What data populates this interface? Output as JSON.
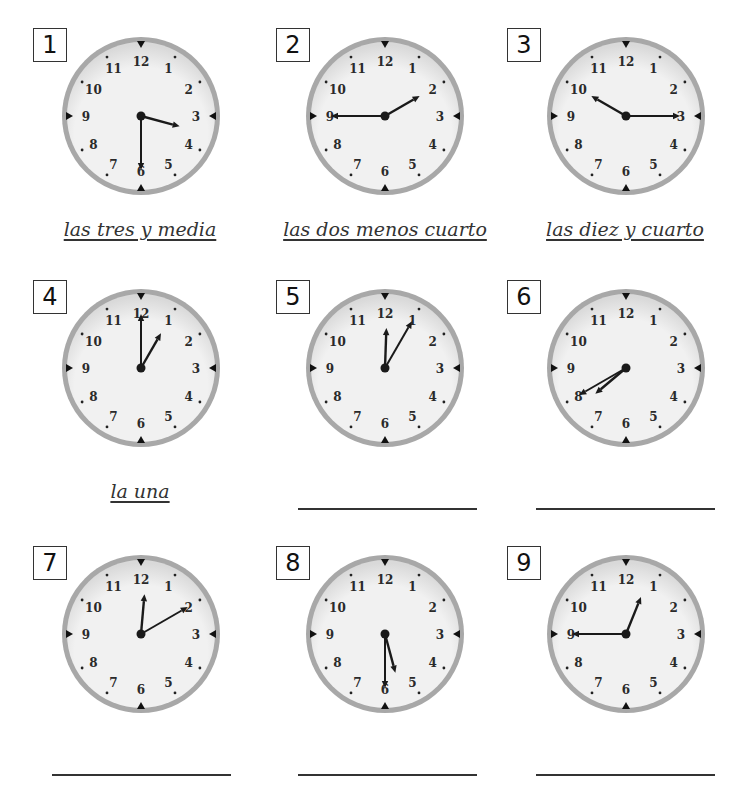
{
  "worksheet": {
    "colors": {
      "rim": "#a8a8a8",
      "face": "#f1f1f1",
      "face_shadow": "#d9d9d9",
      "hand": "#1a1a1a",
      "numerals": "#2a2a2a"
    },
    "clock_numerals": [
      "12",
      "1",
      "2",
      "3",
      "4",
      "5",
      "6",
      "7",
      "8",
      "9",
      "10",
      "11"
    ],
    "items": [
      {
        "number": "1",
        "time": "3:30",
        "hour_hand_deg": 105,
        "minute_hand_deg": 180,
        "answer": "las tres y media",
        "answered": true
      },
      {
        "number": "2",
        "time": "1:45",
        "hour_hand_deg": 60,
        "minute_hand_deg": 270,
        "answer": "las dos menos cuarto",
        "answered": true
      },
      {
        "number": "3",
        "time": "10:15",
        "hour_hand_deg": 300,
        "minute_hand_deg": 90,
        "answer": "las diez y cuarto",
        "answered": true
      },
      {
        "number": "4",
        "time": "1:00",
        "hour_hand_deg": 30,
        "minute_hand_deg": 0,
        "answer": "la una",
        "answered": true
      },
      {
        "number": "5",
        "time": "12:05",
        "hour_hand_deg": 2,
        "minute_hand_deg": 30,
        "answer": "",
        "answered": false
      },
      {
        "number": "6",
        "time": "7:40",
        "hour_hand_deg": 230,
        "minute_hand_deg": 240,
        "answer": "",
        "answered": false
      },
      {
        "number": "7",
        "time": "12:10",
        "hour_hand_deg": 5,
        "minute_hand_deg": 60,
        "answer": "",
        "answered": false
      },
      {
        "number": "8",
        "time": "5:30",
        "hour_hand_deg": 165,
        "minute_hand_deg": 180,
        "answer": "",
        "answered": false
      },
      {
        "number": "9",
        "time": "12:45",
        "hour_hand_deg": 22,
        "minute_hand_deg": 270,
        "answer": "",
        "answered": false
      }
    ]
  }
}
